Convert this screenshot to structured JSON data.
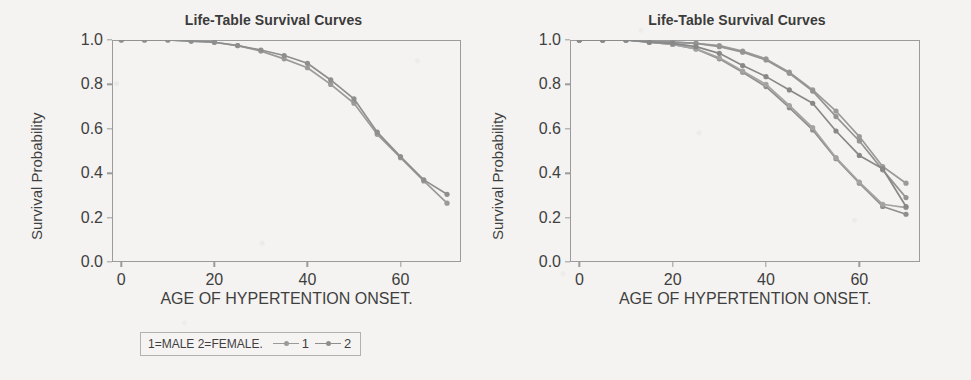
{
  "figure": {
    "panels": [
      {
        "id": "left",
        "title": "Life-Table Survival Curves",
        "xlabel": "AGE OF HYPERTENTION ONSET.",
        "ylabel": "Survival Probability",
        "legend": {
          "caption": "1=MALE 2=FEMALE.",
          "entries": [
            {
              "key": "1",
              "color": "#9a9a9a"
            },
            {
              "key": "2",
              "color": "#8e8e8e"
            }
          ]
        }
      },
      {
        "id": "right",
        "title": "Life-Table Survival Curves",
        "xlabel": "AGE OF HYPERTENTION ONSET.",
        "ylabel": "Survival Probability",
        "legend": {
          "caption": "1=WHITE 2=BLACK 3=HISP 4=ASIAN 5=OTHER.",
          "entries": [
            {
              "key": "1",
              "color": "#9a9a9a"
            },
            {
              "key": "2",
              "color": "#8e8e8e"
            },
            {
              "key": "3",
              "color": "#a3a3a3"
            },
            {
              "key": "4",
              "color": "#949494"
            },
            {
              "key": "5",
              "color": "#888888"
            }
          ]
        }
      }
    ]
  },
  "chart_data": [
    {
      "type": "line",
      "title": "Life-Table Survival Curves",
      "xlabel": "AGE OF HYPERTENTION ONSET.",
      "ylabel": "Survival Probability",
      "xlim": [
        -2,
        73
      ],
      "ylim": [
        0.0,
        1.0
      ],
      "xticks": [
        0,
        20,
        40,
        60
      ],
      "yticks": [
        0.0,
        0.2,
        0.4,
        0.6,
        0.8,
        1.0
      ],
      "grid": false,
      "legend_position": "below-axes",
      "legend_title": "1=MALE 2=FEMALE.",
      "x": [
        0,
        5,
        10,
        15,
        20,
        25,
        30,
        35,
        40,
        45,
        50,
        55,
        60,
        65,
        70
      ],
      "series": [
        {
          "name": "1",
          "label": "MALE",
          "color": "#9a9a9a",
          "values": [
            1.0,
            1.0,
            1.0,
            0.995,
            0.99,
            0.975,
            0.95,
            0.915,
            0.875,
            0.8,
            0.715,
            0.575,
            0.47,
            0.365,
            0.265
          ]
        },
        {
          "name": "2",
          "label": "FEMALE",
          "color": "#8e8e8e",
          "values": [
            1.0,
            1.0,
            1.0,
            0.995,
            0.99,
            0.975,
            0.955,
            0.93,
            0.895,
            0.82,
            0.735,
            0.585,
            0.475,
            0.37,
            0.305
          ]
        }
      ]
    },
    {
      "type": "line",
      "title": "Life-Table Survival Curves",
      "xlabel": "AGE OF HYPERTENTION ONSET.",
      "ylabel": "Survival Probability",
      "xlim": [
        -2,
        73
      ],
      "ylim": [
        0.0,
        1.0
      ],
      "xticks": [
        0,
        20,
        40,
        60
      ],
      "yticks": [
        0.0,
        0.2,
        0.4,
        0.6,
        0.8,
        1.0
      ],
      "grid": false,
      "legend_position": "below-axes",
      "legend_title": "1=WHITE 2=BLACK 3=HISP 4=ASIAN 5=OTHER.",
      "x": [
        0,
        5,
        10,
        15,
        20,
        25,
        30,
        35,
        40,
        45,
        50,
        55,
        60,
        65,
        70
      ],
      "series": [
        {
          "name": "1",
          "label": "WHITE",
          "color": "#9a9a9a",
          "values": [
            1.0,
            1.0,
            1.0,
            0.995,
            0.99,
            0.985,
            0.975,
            0.95,
            0.915,
            0.855,
            0.775,
            0.68,
            0.565,
            0.43,
            0.355
          ]
        },
        {
          "name": "2",
          "label": "BLACK",
          "color": "#8e8e8e",
          "values": [
            1.0,
            1.0,
            1.0,
            0.99,
            0.98,
            0.96,
            0.915,
            0.855,
            0.79,
            0.695,
            0.595,
            0.465,
            0.355,
            0.25,
            0.215
          ]
        },
        {
          "name": "3",
          "label": "HISP",
          "color": "#a3a3a3",
          "values": [
            1.0,
            1.0,
            1.0,
            0.99,
            0.98,
            0.96,
            0.92,
            0.86,
            0.8,
            0.705,
            0.605,
            0.47,
            0.36,
            0.26,
            0.245
          ]
        },
        {
          "name": "4",
          "label": "ASIAN",
          "color": "#949494",
          "values": [
            1.0,
            1.0,
            1.0,
            0.995,
            0.99,
            0.985,
            0.97,
            0.945,
            0.91,
            0.85,
            0.77,
            0.655,
            0.545,
            0.415,
            0.29
          ]
        },
        {
          "name": "5",
          "label": "OTHER",
          "color": "#888888",
          "values": [
            1.0,
            1.0,
            1.0,
            0.99,
            0.985,
            0.97,
            0.94,
            0.885,
            0.835,
            0.775,
            0.715,
            0.59,
            0.48,
            0.42,
            0.25
          ]
        }
      ]
    }
  ]
}
